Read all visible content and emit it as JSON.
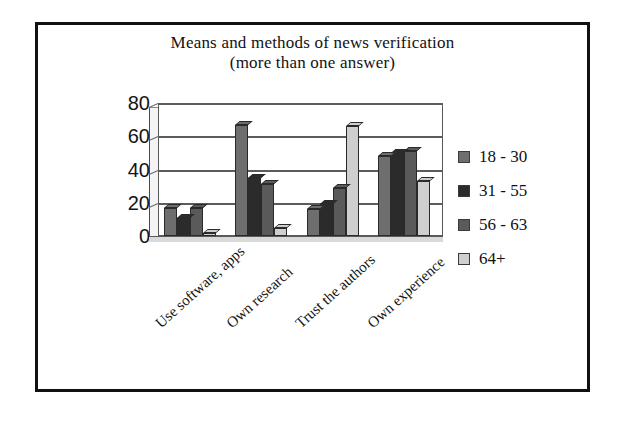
{
  "chart_data": {
    "type": "bar",
    "title": "Means and methods of news verification",
    "subtitle": "(more than one answer)",
    "title_line1": "Means and methods of news verification",
    "title_line2": "(more than one answer)",
    "xlabel": "",
    "ylabel": "",
    "ylim": [
      0,
      80
    ],
    "yticks": [
      80,
      60,
      40,
      20,
      0
    ],
    "grid": true,
    "legend_position": "right",
    "categories": [
      "Use software, apps",
      "Own research",
      "Trust the authors",
      "Own experience"
    ],
    "series": [
      {
        "name": "18 - 30",
        "color": "#6e6e6e",
        "values": [
          17,
          67,
          16,
          48
        ]
      },
      {
        "name": "31 - 55",
        "color": "#2b2b2b",
        "values": [
          11,
          35,
          19,
          50
        ]
      },
      {
        "name": "56 - 63",
        "color": "#5a5a5a",
        "values": [
          17,
          31,
          29,
          51
        ]
      },
      {
        "name": "64+",
        "color": "#cfcfcf",
        "values": [
          2,
          5,
          66,
          33
        ]
      }
    ]
  },
  "legend": {
    "items": [
      {
        "label": "18 - 30",
        "color": "#6e6e6e"
      },
      {
        "label": "31 - 55",
        "color": "#2b2b2b"
      },
      {
        "label": "56 - 63",
        "color": "#5a5a5a"
      },
      {
        "label": "64+",
        "color": "#cfcfcf"
      }
    ]
  },
  "colors": {
    "frame": "#111111",
    "text": "#121212",
    "gridline": "#5c5c5c",
    "background": "#ffffff"
  }
}
